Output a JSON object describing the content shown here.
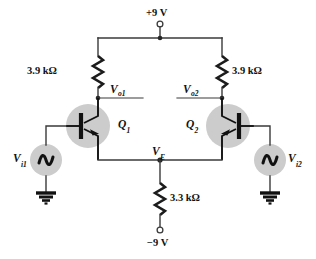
{
  "figure": {
    "name": "differential-amplifier-circuit",
    "type": "schematic"
  },
  "supplies": {
    "positive_label": "+9 V",
    "negative_label": "−9 V"
  },
  "components": {
    "collector_resistor_left": {
      "label": "3.9 kΩ",
      "name": "RC1"
    },
    "collector_resistor_right": {
      "label": "3.9 kΩ",
      "name": "RC2"
    },
    "emitter_resistor": {
      "label": "3.3 kΩ",
      "name": "RE"
    },
    "transistor_left": {
      "label_main": "Q",
      "label_sub": "1",
      "type": "npn"
    },
    "transistor_right": {
      "label_main": "Q",
      "label_sub": "2",
      "type": "npn"
    },
    "source_left": {
      "label_main": "V",
      "label_sub": "i1",
      "type": "ac-source"
    },
    "source_right": {
      "label_main": "V",
      "label_sub": "i2",
      "type": "ac-source"
    }
  },
  "nodes": {
    "output_left": {
      "label_main": "V",
      "label_sub": "o1"
    },
    "output_right": {
      "label_main": "V",
      "label_sub": "o2"
    },
    "emitter_common": {
      "label_main": "V",
      "label_sub": "E"
    }
  },
  "colors": {
    "wire": "#3a3a3a",
    "shade": "#cccccc",
    "ink": "#111111",
    "background": "#ffffff"
  }
}
